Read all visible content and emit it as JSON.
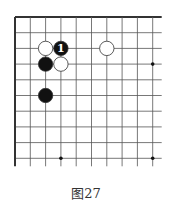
{
  "diagram": {
    "type": "go-board-fragment",
    "caption": "图27",
    "grid": {
      "origin_x": 15,
      "origin_y": 17,
      "spacing_x": 15.3,
      "spacing_y": 15.7,
      "columns": 10,
      "rows": 10,
      "extend_right": 9,
      "extend_bottom": 8,
      "line_color": "#555555",
      "edge_color": "#333333"
    },
    "star_points": [
      {
        "col": 9,
        "row": 3
      },
      {
        "col": 3,
        "row": 9
      },
      {
        "col": 9,
        "row": 9
      }
    ],
    "stones": [
      {
        "col": 2,
        "row": 2,
        "color": "white",
        "label": ""
      },
      {
        "col": 3,
        "row": 2,
        "color": "black",
        "label": "1"
      },
      {
        "col": 6,
        "row": 2,
        "color": "white",
        "label": ""
      },
      {
        "col": 2,
        "row": 3,
        "color": "black",
        "label": ""
      },
      {
        "col": 3,
        "row": 3,
        "color": "white",
        "label": ""
      },
      {
        "col": 2,
        "row": 5,
        "color": "black",
        "label": ""
      }
    ],
    "colors": {
      "black_stone": "#111111",
      "white_stone": "#ffffff",
      "stone_outline": "#333333",
      "label_on_black": "#ffffff"
    }
  }
}
